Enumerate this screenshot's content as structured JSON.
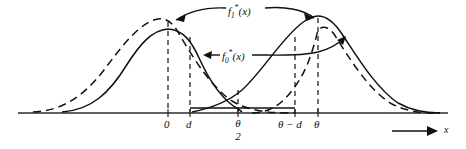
{
  "figure": {
    "title": "",
    "type": "line",
    "axis": {
      "x_label": "x",
      "baseline_y": 113,
      "x_start": 18,
      "x_end": 448,
      "arrow_label_x": "x"
    },
    "ticks": [
      {
        "id": "tick-0-left",
        "label_main": "0",
        "label_sub": "",
        "x": 168
      },
      {
        "id": "tick-d",
        "label_main": "d",
        "label_sub": "",
        "x": 190
      },
      {
        "id": "tick-theta-2",
        "label_main": "θ",
        "label_sub": "2",
        "x": 238
      },
      {
        "id": "tick-theta-minus-d",
        "label_main": "θ − d",
        "label_sub": "",
        "x": 295
      },
      {
        "id": "tick-theta",
        "label_main": "θ",
        "label_sub": "",
        "x": 318
      }
    ],
    "curves": [
      {
        "id": "f1-star",
        "name": "f₁*(x)",
        "style": "solid",
        "peak_x": 168,
        "second_peak_x": 318
      },
      {
        "id": "f0-star",
        "name": "f₀*(x)",
        "style": "dashed",
        "peak_x": 168,
        "second_peak_x": 318
      }
    ],
    "annotations": [
      {
        "id": "label-f1-star",
        "base": "f",
        "sub": "1",
        "star": "*",
        "arg": "(x)",
        "text": "f₁*(x)",
        "x": 228,
        "y": 5
      },
      {
        "id": "label-f0-star",
        "base": "f",
        "sub": "0",
        "star": "*",
        "arg": "(x)",
        "text": "f₀*(x)",
        "x": 222,
        "y": 51
      }
    ],
    "colors": {
      "ink": "#111111",
      "axis": "#2b2b2b",
      "background": "#ffffff"
    }
  }
}
